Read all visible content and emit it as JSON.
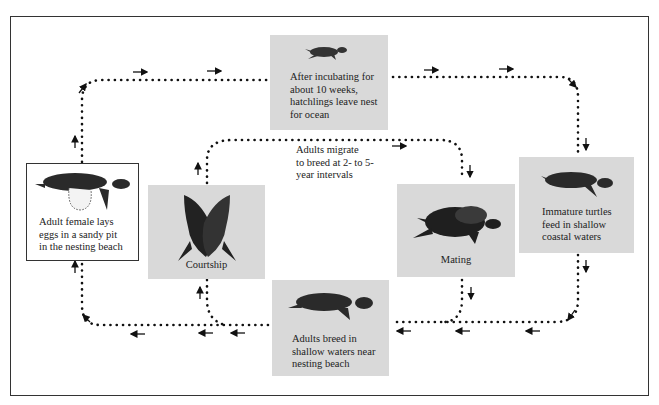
{
  "diagram": {
    "stages": [
      {
        "id": "hatchlings",
        "text": "After incubating for about 10 weeks, hatchlings leave nest for ocean",
        "lines": [
          "After incubating for",
          "about 10 weeks,",
          "hatchlings leave nest",
          "for ocean"
        ]
      },
      {
        "id": "immature",
        "text": "Immature turtles feed in shallow coastal waters",
        "lines": [
          "Immature turtles",
          "feed in shallow",
          "coastal waters"
        ]
      },
      {
        "id": "mating",
        "text": "Mating",
        "lines": [
          "Mating"
        ]
      },
      {
        "id": "breed",
        "text": "Adults breed in shallow waters near nesting beach",
        "lines": [
          "Adults  breed in",
          "shallow waters near",
          "nesting beach"
        ]
      },
      {
        "id": "courtship",
        "text": "Courtship",
        "lines": [
          "Courtship"
        ]
      },
      {
        "id": "nesting",
        "text": "Adult female lays eggs in a sandy pit in the nesting beach",
        "lines": [
          "Adult female lays",
          "eggs in a sandy pit",
          "in the nesting beach"
        ]
      }
    ],
    "migration_note": {
      "lines": [
        "Adults migrate",
        "to breed at 2- to 5-",
        "year intervals"
      ]
    },
    "colors": {
      "box_fill": "#d9d9d9",
      "ink": "#222222",
      "frame": "#333333"
    }
  }
}
